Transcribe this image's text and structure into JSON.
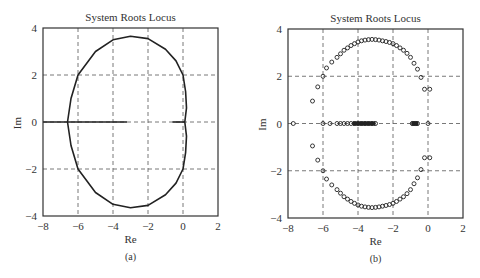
{
  "figure": {
    "caption": "",
    "panels": [
      {
        "id": "a",
        "title": "System Roots Locus",
        "xlabel": "Re",
        "ylabel": "Im",
        "label": "(a)"
      },
      {
        "id": "b",
        "title": "System Roots Locus",
        "xlabel": "Re",
        "ylabel": "Im",
        "label": "(b)"
      }
    ]
  },
  "chart_data": [
    {
      "type": "line",
      "title": "System Roots Locus",
      "xlabel": "Re",
      "ylabel": "Im",
      "subfigure_label": "(a)",
      "xlim": [
        -8,
        2
      ],
      "ylim": [
        -4,
        4
      ],
      "xticks": [
        -8,
        -6,
        -4,
        -2,
        0,
        2
      ],
      "yticks": [
        -4,
        -2,
        0,
        2,
        4
      ],
      "xtick_labels": [
        "-8",
        "-6",
        "-4",
        "-2",
        "0",
        "2"
      ],
      "ytick_labels": [
        "-4",
        "-2",
        "0",
        "2",
        "4"
      ],
      "grid": true,
      "grid_style": "dashed",
      "series": [
        {
          "name": "locus-upper",
          "x": [
            0.1,
            0.2,
            0.15,
            0.0,
            -0.4,
            -1.0,
            -2.0,
            -3.0,
            -4.0,
            -5.0,
            -6.0,
            -6.4,
            -6.6
          ],
          "y": [
            0.0,
            0.6,
            1.3,
            2.0,
            2.6,
            3.1,
            3.55,
            3.65,
            3.5,
            3.0,
            2.0,
            1.0,
            0.0
          ]
        },
        {
          "name": "locus-lower",
          "x": [
            0.1,
            0.2,
            0.15,
            0.0,
            -0.4,
            -1.0,
            -2.0,
            -3.0,
            -4.0,
            -5.0,
            -6.0,
            -6.4,
            -6.6
          ],
          "y": [
            0.0,
            -0.6,
            -1.3,
            -2.0,
            -2.6,
            -3.1,
            -3.55,
            -3.65,
            -3.5,
            -3.0,
            -2.0,
            -1.0,
            0.0
          ]
        },
        {
          "name": "real-axis-left",
          "x": [
            -8,
            -3.2
          ],
          "y": [
            0,
            0
          ]
        },
        {
          "name": "real-axis-right",
          "x": [
            -0.6,
            0.1
          ],
          "y": [
            0,
            0
          ]
        }
      ]
    },
    {
      "type": "scatter",
      "title": "System Roots Locus",
      "xlabel": "Re",
      "ylabel": "Im",
      "subfigure_label": "(b)",
      "xlim": [
        -8,
        2
      ],
      "ylim": [
        -4,
        4
      ],
      "xticks": [
        -8,
        -6,
        -4,
        -2,
        0,
        2
      ],
      "yticks": [
        -4,
        -2,
        0,
        2,
        4
      ],
      "xtick_labels": [
        "-8",
        "-6",
        "-4",
        "-2",
        "0",
        "2"
      ],
      "ytick_labels": [
        "-4",
        "-2",
        "0",
        "2",
        "4"
      ],
      "grid": true,
      "grid_style": "dashed",
      "marker": "o",
      "series": [
        {
          "name": "roots-upper",
          "x": [
            -6.6,
            -6.3,
            -6.0,
            -5.8,
            -5.5,
            -5.2,
            -5.0,
            -4.8,
            -4.6,
            -4.4,
            -4.2,
            -4.0,
            -3.8,
            -3.6,
            -3.4,
            -3.2,
            -3.0,
            -2.8,
            -2.6,
            -2.4,
            -2.2,
            -2.0,
            -1.8,
            -1.6,
            -1.4,
            -1.2,
            -1.0,
            -0.8,
            -0.6,
            -0.4,
            -0.2,
            0.1
          ],
          "y": [
            0.95,
            1.55,
            2.0,
            2.35,
            2.6,
            2.8,
            2.95,
            3.1,
            3.2,
            3.3,
            3.38,
            3.45,
            3.5,
            3.53,
            3.55,
            3.56,
            3.55,
            3.53,
            3.5,
            3.47,
            3.43,
            3.38,
            3.3,
            3.2,
            3.1,
            2.97,
            2.8,
            2.55,
            2.3,
            1.95,
            1.45,
            1.45
          ]
        },
        {
          "name": "roots-lower",
          "x": [
            -6.6,
            -6.3,
            -6.0,
            -5.8,
            -5.5,
            -5.2,
            -5.0,
            -4.8,
            -4.6,
            -4.4,
            -4.2,
            -4.0,
            -3.8,
            -3.6,
            -3.4,
            -3.2,
            -3.0,
            -2.8,
            -2.6,
            -2.4,
            -2.2,
            -2.0,
            -1.8,
            -1.6,
            -1.4,
            -1.2,
            -1.0,
            -0.8,
            -0.6,
            -0.4,
            -0.2,
            0.1
          ],
          "y": [
            -0.95,
            -1.55,
            -2.0,
            -2.35,
            -2.6,
            -2.8,
            -2.95,
            -3.1,
            -3.2,
            -3.3,
            -3.38,
            -3.45,
            -3.5,
            -3.53,
            -3.55,
            -3.56,
            -3.55,
            -3.53,
            -3.5,
            -3.47,
            -3.43,
            -3.38,
            -3.3,
            -3.2,
            -3.1,
            -2.97,
            -2.8,
            -2.55,
            -2.3,
            -1.95,
            -1.45,
            -1.45
          ]
        },
        {
          "name": "roots-real-axis",
          "x": [
            -7.7,
            -6.0,
            -5.6,
            -5.2,
            -5.0,
            -4.8,
            -4.6,
            -4.4,
            -4.2,
            -4.0,
            -3.8,
            -3.6,
            -3.4,
            -3.2,
            -3.0,
            -0.9,
            -0.8,
            -0.7,
            -0.6,
            0.0
          ],
          "y": [
            0,
            0,
            0,
            0,
            0,
            0,
            0,
            0,
            0,
            0,
            0,
            0,
            0,
            0,
            0,
            0,
            0,
            0,
            0,
            0
          ]
        }
      ]
    }
  ]
}
